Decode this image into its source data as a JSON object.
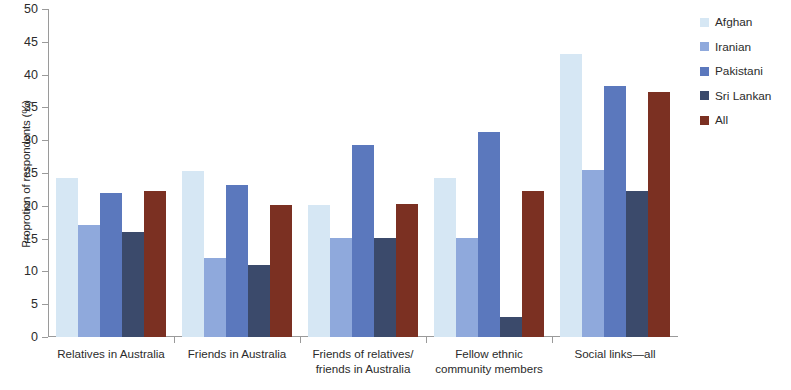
{
  "chart_data": {
    "type": "bar",
    "title": "",
    "subtitle": "",
    "xlabel": "",
    "ylabel": "Proprotion of respondents (%)",
    "ylim": [
      0,
      50
    ],
    "ytick_step": 5,
    "yticks": [
      "50",
      "45",
      "40",
      "35",
      "30",
      "25",
      "20",
      "15",
      "10",
      "5",
      "0"
    ],
    "grid": false,
    "legend_position": "right",
    "categories": [
      "Relatives  in Australia",
      "Friends in Australia",
      "Friends of relatives/\nfriends in Australia",
      "Fellow ethnic\ncommunity members",
      "Social links—all"
    ],
    "series": [
      {
        "name": "Afghan",
        "color": "#d6e7f4",
        "values": [
          24.2,
          25.3,
          20.2,
          24.3,
          43.2
        ]
      },
      {
        "name": "Iranian",
        "color": "#8fa9dc",
        "values": [
          17.0,
          12.0,
          15.1,
          15.1,
          25.4
        ]
      },
      {
        "name": "Pakistani",
        "color": "#5b78bd",
        "values": [
          22.0,
          23.1,
          29.3,
          31.2,
          38.3
        ]
      },
      {
        "name": "Sri Lankan",
        "color": "#3b4a6b",
        "values": [
          16.0,
          11.0,
          15.1,
          3.1,
          22.2
        ]
      },
      {
        "name": "All",
        "color": "#7b3022",
        "values": [
          22.2,
          20.2,
          20.3,
          22.2,
          37.3
        ]
      }
    ]
  },
  "axis": {
    "line_color": "#9a9a9a",
    "text_color": "#2b2b2b"
  }
}
